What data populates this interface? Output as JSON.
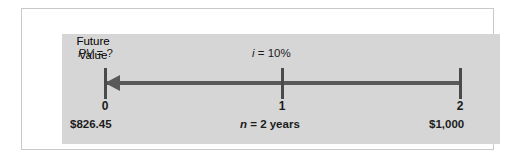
{
  "figure": {
    "type": "timeline-diagram",
    "panel_color": "#d6d6d6",
    "line_color": "#595959",
    "text_color": "#1c1c1c"
  },
  "timeline": {
    "direction": "right-to-left",
    "arrow_points_to": "period 0",
    "periods": [
      {
        "index": 0,
        "tick_label": "0",
        "top_label": "PV = ?",
        "bottom_label": "$826.45"
      },
      {
        "index": 1,
        "tick_label": "1",
        "top_label": "i = 10%",
        "bottom_label": "n = 2 years"
      },
      {
        "index": 2,
        "tick_label": "2",
        "top_label": "Future Value",
        "bottom_label": "$1,000"
      }
    ]
  },
  "labels": {
    "pv_symbol": "PV",
    "pv_rest": " = ?",
    "interest_symbol": "i",
    "interest_rest": " = 10%",
    "future_value_line1": "Future",
    "future_value_line2": "Value",
    "tick_0": "0",
    "tick_1": "1",
    "tick_2": "2",
    "pv_amount": "$826.45",
    "fv_amount": "$1,000",
    "n_symbol": "n",
    "n_rest": " = 2 years"
  },
  "chart_data": {
    "type": "line",
    "x": [
      0,
      1,
      2
    ],
    "categories": [
      "0",
      "1",
      "2"
    ],
    "values": [
      826.45,
      null,
      1000
    ],
    "xlabel": "n = 2 years",
    "ylabel": "",
    "annotations": [
      "PV = ?",
      "i = 10%",
      "Future Value",
      "$826.45",
      "$1,000",
      "n = 2 years"
    ],
    "grid": false,
    "legend": "none"
  }
}
